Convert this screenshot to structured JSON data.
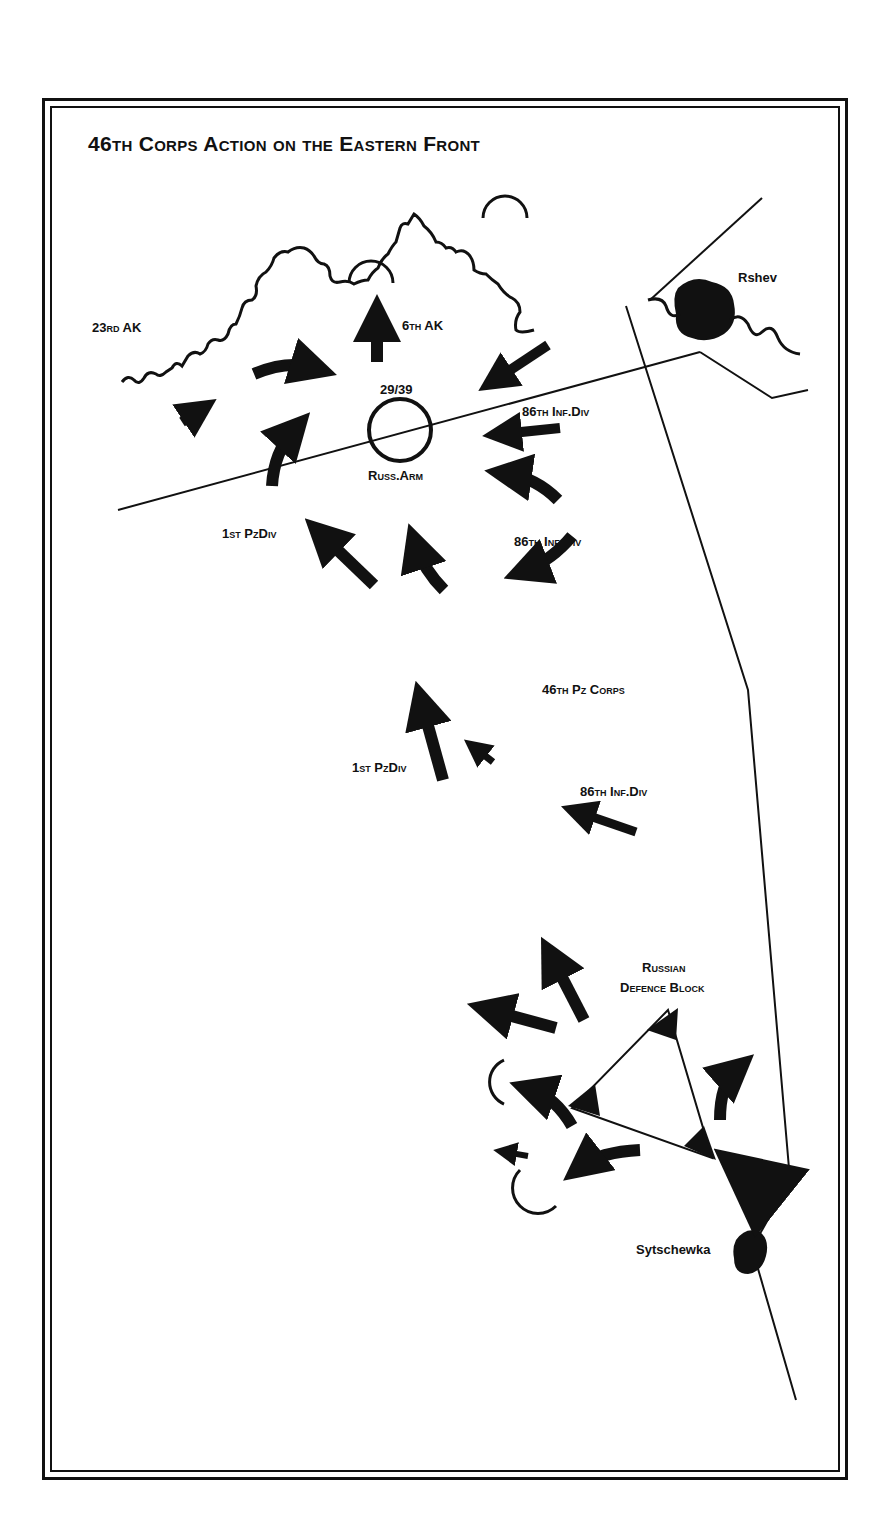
{
  "title": "46th Corps Action on the Eastern Front",
  "places": {
    "rshev": "Rshev",
    "sytschewka": "Sytschewka"
  },
  "units": {
    "corps_23": "23rd AK",
    "corps_6": "6th AK",
    "russ_arm_number": "29/39",
    "russ_arm": "Russ.Arm",
    "inf86_a": "86th Inf.Div",
    "inf86_b": "86th Inf.Div",
    "inf86_c": "86th Inf.Div",
    "pz1_a": "1st PzDiv",
    "pz1_b": "1st PzDiv",
    "pz_corps_46": "46th Pz Corps",
    "defence_block_line1": "Russian",
    "defence_block_line2": "Defence Block"
  },
  "colors": {
    "ink": "#111111",
    "paper": "#ffffff"
  }
}
